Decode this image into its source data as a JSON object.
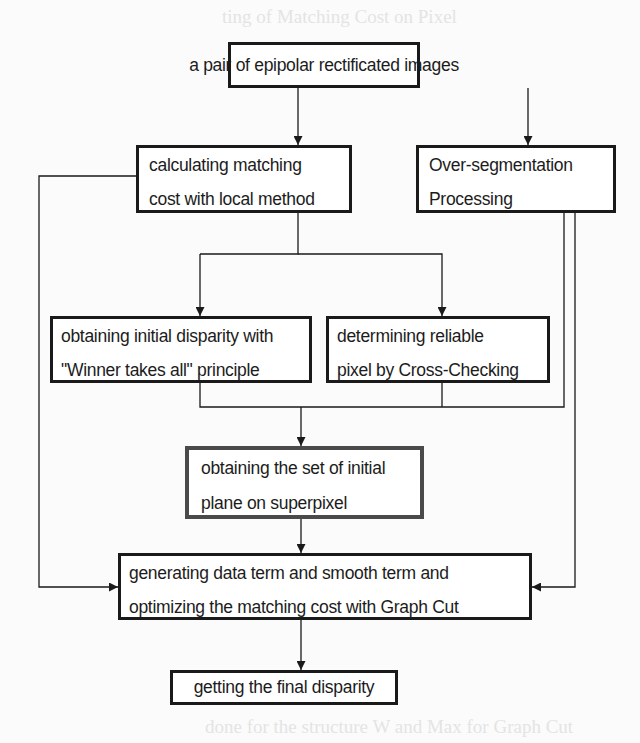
{
  "background_text": {
    "heading_fragment": "ting of Matching Cost on Pixel",
    "bottom_fragment": "done for the structure W and Max for Graph Cut"
  },
  "diagram": {
    "type": "flowchart",
    "nodes": {
      "input": {
        "lines": [
          "a pair of epipolar rectificated images"
        ]
      },
      "local_cost": {
        "lines": [
          "calculating matching",
          "cost with local method"
        ]
      },
      "over_segmentation": {
        "lines": [
          "Over-segmentation",
          "Processing"
        ]
      },
      "initial_disparity": {
        "lines": [
          "obtaining initial disparity with",
          "\"Winner takes all\" principle"
        ]
      },
      "cross_checking": {
        "lines": [
          "determining reliable",
          "pixel by Cross-Checking"
        ]
      },
      "initial_plane": {
        "lines": [
          "obtaining the set of initial",
          "plane on superpixel"
        ]
      },
      "graph_cut": {
        "lines": [
          "generating data term and smooth term and",
          "optimizing the matching cost with Graph Cut"
        ]
      },
      "final": {
        "lines": [
          "getting the final disparity"
        ]
      }
    },
    "edges": [
      {
        "from": "input",
        "to": "local_cost"
      },
      {
        "from": "input",
        "to": "over_segmentation"
      },
      {
        "from": "local_cost",
        "to": "initial_disparity"
      },
      {
        "from": "local_cost",
        "to": "cross_checking"
      },
      {
        "from": "initial_disparity",
        "to": "initial_plane"
      },
      {
        "from": "cross_checking",
        "to": "initial_plane"
      },
      {
        "from": "over_segmentation",
        "to": "initial_plane"
      },
      {
        "from": "initial_plane",
        "to": "graph_cut"
      },
      {
        "from": "local_cost",
        "to": "graph_cut"
      },
      {
        "from": "over_segmentation",
        "to": "graph_cut"
      },
      {
        "from": "graph_cut",
        "to": "final"
      }
    ],
    "colors": {
      "stroke": "#1a1a1a",
      "box_fill": "#ffffff",
      "text": "#1c1c1c",
      "page": "#fbfbfb"
    }
  }
}
